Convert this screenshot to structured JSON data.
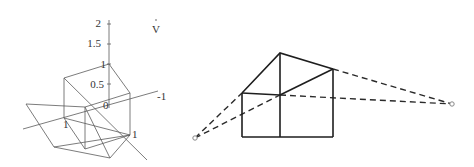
{
  "left_figure": {
    "title": "3D cube with projection plane",
    "vertical_axis_ticks": [
      "2",
      "1.5",
      "1",
      "0.5",
      "0"
    ],
    "axis_labels": {
      "top_right": "V",
      "horizontal_end": "-1",
      "left_point": "1",
      "right_point": "1"
    }
  },
  "right_figure": {
    "title": "Two-point perspective box",
    "vanishing_points": [
      "left",
      "right"
    ]
  }
}
